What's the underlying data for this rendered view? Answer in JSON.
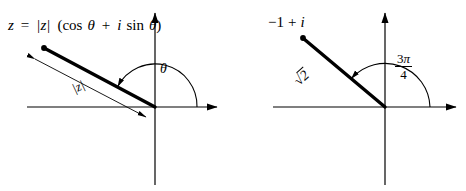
{
  "figure": {
    "background": "#ffffff",
    "ink": "#000000",
    "caption": "Polar form of a complex number: general case and the example -1 + i"
  },
  "panels": [
    {
      "id": "left",
      "name": "general-polar-form",
      "origin": {
        "x": 155,
        "y": 107
      },
      "axes": {
        "horizontal": {
          "x1": 27,
          "x2": 222,
          "y": 107,
          "arrow": "right"
        },
        "vertical": {
          "y1": 8,
          "y2": 185,
          "x": 155,
          "arrow": "up"
        }
      },
      "vector": {
        "from": {
          "x": 155,
          "y": 107
        },
        "to": {
          "x": 44,
          "y": 48
        },
        "has_endpoint_dot": true,
        "angle_deg": 152
      },
      "dimension_arrow": {
        "from": {
          "x": 33,
          "y": 58
        },
        "to": {
          "x": 148,
          "y": 118
        },
        "double_headed": true,
        "label": "|z|"
      },
      "arc": {
        "radius": 42,
        "start_deg": 0,
        "end_deg": 152,
        "arrowhead_at": "end"
      },
      "labels": {
        "formula": "z = |z| (cos θ + i sin θ)",
        "formula_parts": {
          "z": "z",
          "equals": "=",
          "modulus": "|z|",
          "open": "(",
          "cos": "cos",
          "theta": "θ",
          "plus": "+",
          "i": "i",
          "sin": "sin",
          "close": ")"
        },
        "angle": "θ",
        "magnitude": "|z|"
      }
    },
    {
      "id": "right",
      "name": "example-minus-one-plus-i",
      "origin": {
        "x": 385,
        "y": 107
      },
      "axes": {
        "horizontal": {
          "x1": 273,
          "x2": 460,
          "y": 107,
          "arrow": "right"
        },
        "vertical": {
          "y1": 8,
          "y2": 185,
          "x": 385,
          "arrow": "up"
        }
      },
      "vector": {
        "from": {
          "x": 385,
          "y": 107
        },
        "to": {
          "x": 303,
          "y": 38
        },
        "has_endpoint_dot": true,
        "angle_deg": 140
      },
      "arc": {
        "radius": 45,
        "start_deg": 0,
        "end_deg": 140,
        "arrowhead_at": "end"
      },
      "labels": {
        "point": "−1 + i",
        "point_parts": {
          "real": "−1",
          "plus": "+",
          "imaginary": "i"
        },
        "magnitude": "√2",
        "magnitude_parts": {
          "radical": "√",
          "radicand": "2"
        },
        "angle": "3π/4",
        "angle_parts": {
          "numerator_coefficient": "3",
          "numerator_symbol": "π",
          "denominator": "4"
        }
      }
    }
  ]
}
